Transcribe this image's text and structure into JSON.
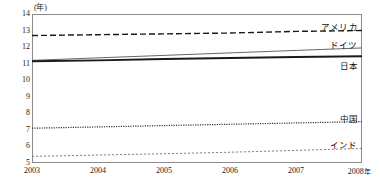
{
  "chart_data": {
    "type": "line",
    "title": "",
    "subtitle": "",
    "xlabel": "",
    "ylabel": "(年)",
    "y_unit_caption": "(年)",
    "grid": false,
    "legend_position": "right-inline-end-labels",
    "x": [
      2003,
      2004,
      2005,
      2006,
      2007,
      2008
    ],
    "xlim": [
      2003,
      2008
    ],
    "ylim": [
      5,
      14
    ],
    "yticks": [
      14,
      13,
      12,
      11,
      10,
      9,
      8,
      7,
      6,
      5
    ],
    "xticks": [
      "2003",
      "2004",
      "2005",
      "2006",
      "2007",
      "2008"
    ],
    "xtick_suffix": "年",
    "xtick_suffix_on": "2008",
    "series": [
      {
        "name": "アメリカ",
        "label": "アメリカ",
        "style": "dashed",
        "color": "#1a1a1a",
        "width": 1.4,
        "values": [
          12.7,
          12.75,
          12.8,
          12.85,
          12.95,
          13.0
        ]
      },
      {
        "name": "ドイツ",
        "label": "ドイツ",
        "style": "solid-thin",
        "color": "#555555",
        "width": 0.9,
        "values": [
          11.2,
          11.35,
          11.5,
          11.65,
          11.8,
          11.95
        ]
      },
      {
        "name": "日本",
        "label": "日本",
        "style": "solid-thick",
        "color": "#1a1a1a",
        "width": 1.9,
        "values": [
          11.15,
          11.2,
          11.28,
          11.34,
          11.4,
          11.45
        ]
      },
      {
        "name": "中国",
        "label": "中国",
        "style": "dotted",
        "color": "#333333",
        "width": 1.2,
        "values": [
          7.1,
          7.18,
          7.26,
          7.34,
          7.42,
          7.5
        ]
      },
      {
        "name": "インド",
        "label": "インド",
        "style": "fine-dashed",
        "color": "#777777",
        "width": 0.9,
        "values": [
          5.4,
          5.48,
          5.56,
          5.65,
          5.76,
          5.88
        ]
      }
    ]
  },
  "colors": {
    "frame": "#8c8c8c",
    "text": "#1a1a1a",
    "background": "#ffffff"
  }
}
